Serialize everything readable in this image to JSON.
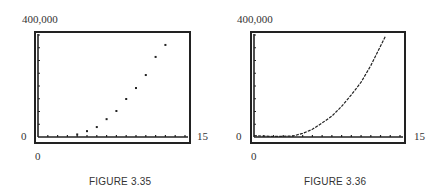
{
  "figures": [
    {
      "caption": "FIGURE 3.35",
      "y_max_label": "400,000",
      "y_min_label": "0",
      "x_min_label": "0",
      "x_max_label": "15"
    },
    {
      "caption": "FIGURE 3.36",
      "y_max_label": "400,000",
      "y_min_label": "0",
      "x_min_label": "0",
      "x_max_label": "15"
    }
  ],
  "chart_data": [
    {
      "type": "scatter",
      "title": "FIGURE 3.35",
      "xlabel": "",
      "ylabel": "",
      "xlim": [
        0,
        15
      ],
      "ylim": [
        0,
        400000
      ],
      "x_tick_step": 1,
      "y_tick_step": 50000,
      "grid": false,
      "x": [
        4,
        5,
        6,
        7,
        8,
        9,
        10,
        11,
        12,
        13
      ],
      "y": [
        10000,
        23000,
        39000,
        70000,
        102000,
        149000,
        192000,
        243000,
        314000,
        361000
      ]
    },
    {
      "type": "line",
      "title": "FIGURE 3.36",
      "xlabel": "",
      "ylabel": "",
      "xlim": [
        0,
        15
      ],
      "ylim": [
        0,
        400000
      ],
      "x_tick_step": 1,
      "y_tick_step": 50000,
      "grid": false,
      "x": [
        0,
        2,
        4,
        5,
        6,
        7,
        8,
        9,
        10,
        11,
        12,
        13.5
      ],
      "y": [
        5000,
        2000,
        4000,
        14000,
        30000,
        55000,
        82000,
        120000,
        165000,
        215000,
        280000,
        395000
      ]
    }
  ]
}
